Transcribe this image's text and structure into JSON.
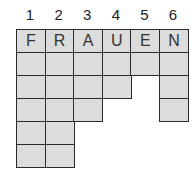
{
  "puzzle": {
    "columns": [
      {
        "number": "1",
        "letter": "F",
        "length": 6
      },
      {
        "number": "2",
        "letter": "R",
        "length": 6
      },
      {
        "number": "3",
        "letter": "A",
        "length": 4
      },
      {
        "number": "4",
        "letter": "U",
        "length": 3
      },
      {
        "number": "5",
        "letter": "E",
        "length": 2
      },
      {
        "number": "6",
        "letter": "N",
        "length": 4
      }
    ],
    "colors": {
      "cell_fill": "#dcdcdc",
      "border": "#2a2a2a"
    }
  }
}
